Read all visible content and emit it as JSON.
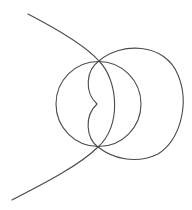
{
  "diagram": {
    "background": "#ffffff",
    "stroke_color": "#4a4a4a",
    "stroke_width": 1.1,
    "elements": {
      "left_circle": {
        "cx": 98.5,
        "cy": 104,
        "r": 42.5
      },
      "right_loop": {
        "d": "M99,61 C120,42 165,42 178,75 C190,104 180,140 158,154 C135,165 112,158 98,147"
      },
      "inner_cusp_curve": {
        "d": "M99,61 C86,70 84,92 97,104 C84,116 86,138 98,147"
      },
      "outer_branch_curve": {
        "d": "M28,14 C55,28 85,45 99,61 C118,80 122,126 98,147 C80,165 45,183 12,200"
      }
    }
  }
}
